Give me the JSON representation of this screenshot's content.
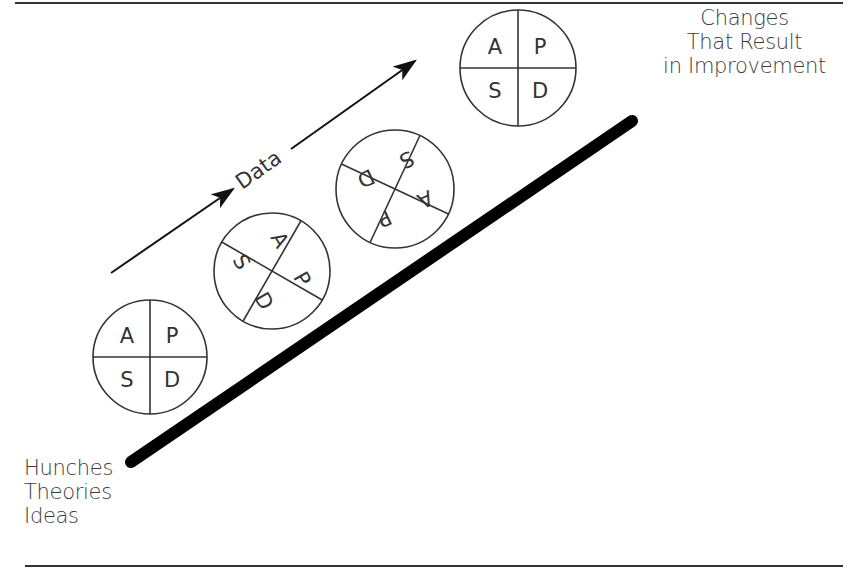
{
  "diagram": {
    "start_label": {
      "lines": [
        "Hunches",
        "Theories",
        "Ideas"
      ]
    },
    "end_label": {
      "lines": [
        "Changes",
        "That Result",
        "in Improvement"
      ]
    },
    "arrow_label": "Data",
    "cycles": [
      {
        "name": "cycle-1",
        "quadrants": {
          "top_left": "A",
          "top_right": "P",
          "bottom_left": "S",
          "bottom_right": "D"
        },
        "rotation_deg": 0
      },
      {
        "name": "cycle-2",
        "quadrants": {
          "top_left": "A",
          "top_right": "P",
          "bottom_left": "S",
          "bottom_right": "D"
        },
        "rotation_deg": -60
      },
      {
        "name": "cycle-3",
        "quadrants": {
          "top_left": "A",
          "top_right": "P",
          "bottom_left": "S",
          "bottom_right": "D"
        },
        "rotation_deg": -155
      },
      {
        "name": "cycle-4",
        "quadrants": {
          "top_left": "A",
          "top_right": "P",
          "bottom_left": "S",
          "bottom_right": "D"
        },
        "rotation_deg": 0
      }
    ],
    "colors": {
      "ramp": "#000000",
      "stroke": "#333333",
      "text": "#3a3a3a",
      "background": "#ffffff"
    }
  }
}
